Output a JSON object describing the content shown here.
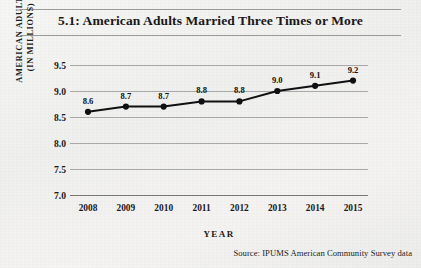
{
  "figure": {
    "title": "5.1: American Adults Married Three Times or More",
    "source_note": "Source:  IPUMS American Community Survey data"
  },
  "chart_data": {
    "type": "line",
    "title": "5.1: American Adults Married Three Times or More",
    "xlabel": "YEAR",
    "ylabel": "AMERICAN ADULTS (IN MILLIONS)",
    "ylabel_lines": [
      "AMERICAN ADULTS",
      "(IN MILLIONS)"
    ],
    "categories": [
      "2008",
      "2009",
      "2010",
      "2011",
      "2012",
      "2013",
      "2014",
      "2015"
    ],
    "values": [
      8.6,
      8.7,
      8.7,
      8.8,
      8.8,
      9.0,
      9.1,
      9.2
    ],
    "point_labels": [
      "8.6",
      "8.7",
      "8.7",
      "8.8",
      "8.8",
      "9.0",
      "9.1",
      "9.2"
    ],
    "ylim": [
      7.0,
      9.5
    ],
    "yticks": [
      "9.5",
      "9.0",
      "8.5",
      "8.0",
      "7.5",
      "7.0"
    ],
    "ytick_values": [
      9.5,
      9.0,
      8.5,
      8.0,
      7.5,
      7.0
    ],
    "grid": true,
    "legend": false,
    "marker": "filled-circle",
    "line_color": "#101012",
    "marker_color": "#101012",
    "grid_color": "#a9a9a9",
    "background": "#f2f2f0"
  }
}
